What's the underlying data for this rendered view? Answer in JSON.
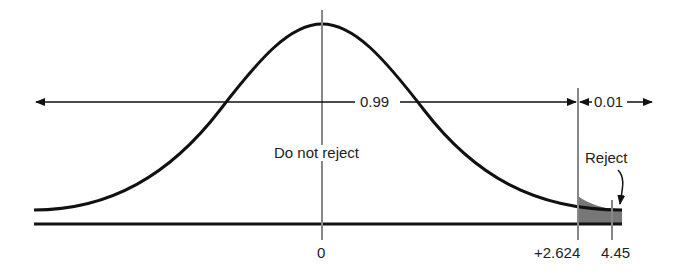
{
  "diagram": {
    "type": "one-tailed hypothesis test, standard normal distribution",
    "labels": {
      "accept_area": "0.99",
      "reject_area": "0.01",
      "do_not_reject": "Do not reject",
      "reject": "Reject"
    },
    "axis_ticks": {
      "center": "0",
      "critical_value": "+2.624",
      "test_statistic": "4.45"
    },
    "colors": {
      "curve": "#111111",
      "guide_lines": "#888888",
      "rejection_region": "#777777"
    }
  }
}
